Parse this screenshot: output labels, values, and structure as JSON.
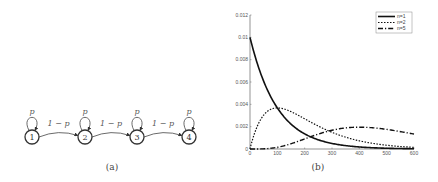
{
  "diagram_a": {
    "caption": "(a)",
    "nodes": [
      {
        "label": "1",
        "cx": 32,
        "cy": 137
      },
      {
        "label": "2",
        "cx": 85,
        "cy": 137
      },
      {
        "label": "3",
        "cx": 137,
        "cy": 137
      },
      {
        "label": "4",
        "cx": 189,
        "cy": 137
      }
    ],
    "self_loop_label": "p",
    "transition_label": "1 − p"
  },
  "chart_b": {
    "caption": "(b)",
    "legend": [
      "n=1",
      "n=2",
      "n=5"
    ]
  },
  "chart_data": {
    "type": "line",
    "title": "",
    "xlabel": "",
    "ylabel": "",
    "xlim": [
      0,
      600
    ],
    "ylim": [
      0,
      0.012
    ],
    "x_ticks": [
      "0",
      "100",
      "200",
      "300",
      "400",
      "500",
      "600"
    ],
    "y_ticks": [
      "0",
      "0.002",
      "0.004",
      "0.006",
      "0.008",
      "0.01",
      "0.012"
    ],
    "legend_position": "upper right",
    "grid": false,
    "x": [
      0,
      50,
      100,
      150,
      200,
      250,
      300,
      350,
      400,
      450,
      500,
      550,
      600
    ],
    "series": [
      {
        "name": "n=1",
        "style": "solid",
        "values": [
          0.01,
          0.00607,
          0.00368,
          0.00223,
          0.00135,
          0.00082,
          0.0005,
          0.0003,
          0.00018,
          0.00011,
          7e-05,
          4e-05,
          2e-05
        ]
      },
      {
        "name": "n=2",
        "style": "dotted",
        "values": [
          0,
          0.00303,
          0.00368,
          0.00335,
          0.00271,
          0.00205,
          0.00149,
          0.00106,
          0.00073,
          0.0005,
          0.00034,
          0.00022,
          0.00015
        ]
      },
      {
        "name": "n=5",
        "style": "dash-dot",
        "values": [
          0,
          2e-05,
          0.00015,
          0.00047,
          0.0009,
          0.00133,
          0.00168,
          0.0019,
          0.00195,
          0.00186,
          0.00175,
          0.00155,
          0.00134
        ]
      }
    ]
  }
}
